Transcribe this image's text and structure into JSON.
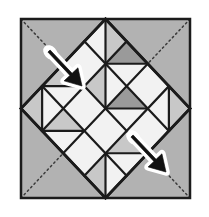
{
  "figure": {
    "width": 209,
    "height": 217
  },
  "colors": {
    "page_background": "#ffffff",
    "frame_border": "#1b1b1b",
    "background_gray": "#b2b2b2",
    "light_patch": "#f2f2f2",
    "mid_gray_patch": "#c8c8c8",
    "dark_gray_patch": "#9a9a9a",
    "seam_line": "#1b1b1b",
    "dotted_diagonal": "#3a3a3a",
    "arrow_outline": "#ffffff",
    "arrow_body": "#111111"
  },
  "frame": {
    "name": "outer-square",
    "x": 21,
    "y": 19,
    "width": 169,
    "height": 179,
    "border_width": 2.5
  },
  "diamond": {
    "name": "on-point-diamond",
    "center_x": 105.5,
    "center_y": 108.5,
    "half_width": 84.5,
    "half_height": 89.5,
    "grid": 4
  },
  "diagonals": [
    {
      "name": "diagonal-tl-br",
      "x1": 21,
      "y1": 19,
      "x2": 190,
      "y2": 198
    },
    {
      "name": "diagonal-tr-bl",
      "x1": 190,
      "y1": 19,
      "x2": 21,
      "y2": 198
    }
  ],
  "patches": [
    {
      "row": 0,
      "col": 0,
      "kind": "split-lower",
      "fill_a": "#f2f2f2",
      "fill_b": "#c8c8c8",
      "split": "nw-se"
    },
    {
      "row": 0,
      "col": 1,
      "kind": "split-left-dark",
      "fill_a": "#9a9a9a",
      "fill_b": "#f2f2f2",
      "split": "ne-sw"
    },
    {
      "row": 0,
      "col": 2,
      "kind": "plain",
      "fill_a": "#f2f2f2",
      "fill_b": "#f2f2f2",
      "split": "none"
    },
    {
      "row": 0,
      "col": 3,
      "kind": "split-lower",
      "fill_a": "#f2f2f2",
      "fill_b": "#c8c8c8",
      "split": "nw-se"
    },
    {
      "row": 1,
      "col": 0,
      "kind": "plain",
      "fill_a": "#f2f2f2",
      "fill_b": "#f2f2f2",
      "split": "none"
    },
    {
      "row": 1,
      "col": 1,
      "kind": "split-lower",
      "fill_a": "#c8c8c8",
      "fill_b": "#f2f2f2",
      "split": "nw-se"
    },
    {
      "row": 1,
      "col": 2,
      "kind": "split-upper-dark",
      "fill_a": "#9a9a9a",
      "fill_b": "#f2f2f2",
      "split": "ne-sw"
    },
    {
      "row": 1,
      "col": 3,
      "kind": "plain",
      "fill_a": "#f2f2f2",
      "fill_b": "#f2f2f2",
      "split": "none"
    },
    {
      "row": 2,
      "col": 0,
      "kind": "split-upper",
      "fill_a": "#c8c8c8",
      "fill_b": "#f2f2f2",
      "split": "ne-sw"
    },
    {
      "row": 2,
      "col": 1,
      "kind": "plain",
      "fill_a": "#f2f2f2",
      "fill_b": "#f2f2f2",
      "split": "none"
    },
    {
      "row": 2,
      "col": 2,
      "kind": "plain",
      "fill_a": "#f2f2f2",
      "fill_b": "#f2f2f2",
      "split": "none"
    },
    {
      "row": 2,
      "col": 3,
      "kind": "split-upper",
      "fill_a": "#c8c8c8",
      "fill_b": "#f2f2f2",
      "split": "ne-sw"
    },
    {
      "row": 3,
      "col": 0,
      "kind": "split-upper",
      "fill_a": "#c8c8c8",
      "fill_b": "#f2f2f2",
      "split": "nw-se"
    },
    {
      "row": 3,
      "col": 1,
      "kind": "split-upper",
      "fill_a": "#c8c8c8",
      "fill_b": "#f2f2f2",
      "split": "ne-sw"
    },
    {
      "row": 3,
      "col": 2,
      "kind": "plain",
      "fill_a": "#f2f2f2",
      "fill_b": "#f2f2f2",
      "split": "none"
    },
    {
      "row": 3,
      "col": 3,
      "kind": "split-upper",
      "fill_a": "#c8c8c8",
      "fill_b": "#f2f2f2",
      "split": "nw-se"
    }
  ],
  "arrows": [
    {
      "name": "fold-arrow-upper-left",
      "tail_x": 49,
      "tail_y": 51,
      "tip_x": 82,
      "tip_y": 86,
      "direction": "down-right"
    },
    {
      "name": "fold-arrow-lower-right",
      "tail_x": 132,
      "tail_y": 136,
      "tip_x": 166,
      "tip_y": 172,
      "direction": "down-right"
    }
  ]
}
